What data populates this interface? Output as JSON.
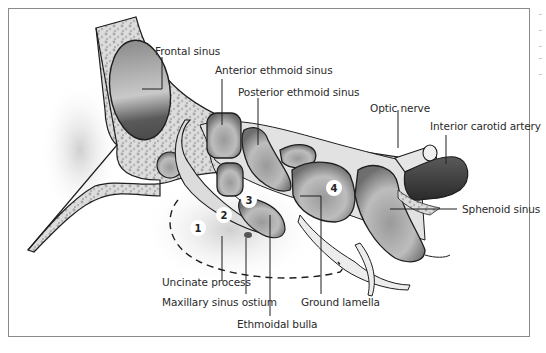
{
  "figure": {
    "type": "anatomical-illustration",
    "colors": {
      "frame": "#8a8a8a",
      "outline": "#1e1e1e",
      "bone": "#d9d9d9",
      "sinus_dark": "#5a5a5a",
      "artery": "#3a3a3a",
      "label_text": "#2a2a2a"
    }
  },
  "labels": {
    "frontal_sinus": "Frontal sinus",
    "anterior_ethmoid_sinus": "Anterior ethmoid sinus",
    "posterior_ethmoid_sinus": "Posterior ethmoid sinus",
    "optic_nerve": "Optic nerve",
    "interior_carotid_artery": "Interior carotid artery",
    "sphenoid_sinus": "Sphenoid sinus",
    "uncinate_process": "Uncinate process",
    "maxillary_sinus_ostium": "Maxillary sinus ostium",
    "ethmoidal_bulla": "Ethmoidal bulla",
    "ground_lamella": "Ground lamella"
  },
  "markers": [
    "1",
    "2",
    "3",
    "4"
  ]
}
